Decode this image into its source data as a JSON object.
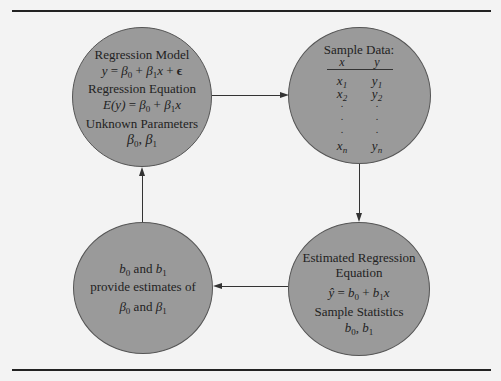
{
  "diagram": {
    "colors": {
      "background": "#f3f3f3",
      "circle_fill": "#9a9a9a",
      "line": "#333333"
    },
    "top_left": {
      "title1": "Regression Model",
      "model_eq": {
        "lhs": "y",
        "eq": " = ",
        "b0": "β",
        "b0_sub": "0",
        "plus1": " + ",
        "b1": "β",
        "b1_sub": "1",
        "x": "x",
        "plus2": " + ",
        "eps": "ϵ"
      },
      "title2": "Regression Equation",
      "reg_eq": {
        "lhs": "E(y)",
        "eq": " = ",
        "b0": "β",
        "b0_sub": "0",
        "plus": " + ",
        "b1": "β",
        "b1_sub": "1",
        "x": "x"
      },
      "title3": "Unknown Parameters",
      "params": {
        "b0": "β",
        "b0_sub": "0",
        "sep": ", ",
        "b1": "β",
        "b1_sub": "1"
      }
    },
    "top_right": {
      "title": "Sample Data:",
      "headers": {
        "x": "x",
        "y": "y"
      },
      "rows": [
        {
          "x": "x",
          "xs": "1",
          "y": "y",
          "ys": "1"
        },
        {
          "x": "x",
          "xs": "2",
          "y": "y",
          "ys": "2"
        },
        {
          "x": ".",
          "xs": "",
          "y": ".",
          "ys": ""
        },
        {
          "x": ".",
          "xs": "",
          "y": ".",
          "ys": ""
        },
        {
          "x": ".",
          "xs": "",
          "y": ".",
          "ys": ""
        },
        {
          "x": "x",
          "xs": "n",
          "y": "y",
          "ys": "n"
        }
      ]
    },
    "bottom_right": {
      "title1": "Estimated Regression",
      "title2": "Equation",
      "est_eq": {
        "yhat": "ŷ",
        "eq": " = ",
        "b0": "b",
        "b0_sub": "0",
        "plus": " + ",
        "b1": "b",
        "b1_sub": "1",
        "x": "x"
      },
      "title3": "Sample Statistics",
      "stats": {
        "b0": "b",
        "b0_sub": "0",
        "sep": ", ",
        "b1": "b",
        "b1_sub": "1"
      }
    },
    "bottom_left": {
      "line1": {
        "b0": "b",
        "b0_sub": "0",
        "and": " and ",
        "b1": "b",
        "b1_sub": "1"
      },
      "line2": "provide estimates of",
      "line3": {
        "b0": "β",
        "b0_sub": "0",
        "and": " and ",
        "b1": "β",
        "b1_sub": "1"
      }
    },
    "arrows": [
      {
        "from": "top_left",
        "to": "top_right",
        "direction": "right"
      },
      {
        "from": "top_right",
        "to": "bottom_right",
        "direction": "down"
      },
      {
        "from": "bottom_right",
        "to": "bottom_left",
        "direction": "left"
      },
      {
        "from": "bottom_left",
        "to": "top_left",
        "direction": "up"
      }
    ]
  }
}
